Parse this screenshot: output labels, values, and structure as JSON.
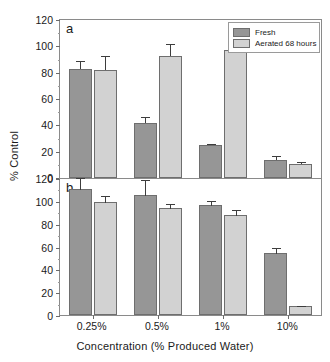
{
  "chart_data": {
    "type": "bar",
    "title": "",
    "xlabel": "Concentration (% Produced Water)",
    "ylabel": "% Control",
    "categories": [
      "0.25%",
      "0.5%",
      "1%",
      "10%"
    ],
    "legend": [
      "Fresh",
      "Aerated 68 hours"
    ],
    "legend_position": "top-right",
    "grid": false,
    "colors": {
      "fresh": "#969696",
      "aerated": "#d2d2d2",
      "error": "#3d3d3d",
      "axis": "#8a8a8a"
    },
    "panels": [
      {
        "label": "a",
        "ylim": [
          0,
          120
        ],
        "yticks": [
          0,
          20,
          40,
          60,
          80,
          100,
          120
        ],
        "ytick_labels": [
          "0",
          "20",
          "40",
          "60",
          "80",
          "100",
          "120"
        ],
        "series": [
          {
            "name": "Fresh",
            "values": [
              83,
              42,
              25,
              14
            ],
            "errors": [
              6,
              4,
              1,
              3
            ]
          },
          {
            "name": "Aerated 68 hours",
            "values": [
              82,
              93,
              97,
              11
            ],
            "errors": [
              11,
              9,
              2,
              1
            ]
          }
        ]
      },
      {
        "label": "b",
        "ylim": [
          0,
          120
        ],
        "yticks": [
          0,
          20,
          40,
          60,
          80,
          100,
          120
        ],
        "ytick_labels": [
          "0",
          "20",
          "40",
          "60",
          "80",
          "100",
          "120"
        ],
        "series": [
          {
            "name": "Fresh",
            "values": [
              110,
              105,
              96,
              54
            ],
            "errors": [
              11,
              14,
              5,
              6
            ]
          },
          {
            "name": "Aerated 68 hours",
            "values": [
              99,
              94,
              88,
              8
            ],
            "errors": [
              6,
              4,
              5,
              1
            ]
          }
        ]
      }
    ]
  }
}
